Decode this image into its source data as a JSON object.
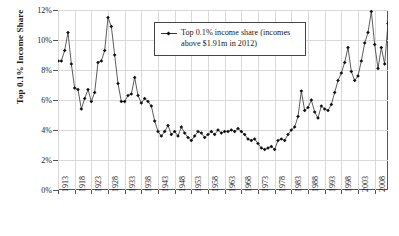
{
  "axes": {
    "ylabel": "Top 0.1% Income Share",
    "yticks": [
      "0%",
      "2%",
      "4%",
      "6%",
      "8%",
      "10%",
      "12%"
    ],
    "xticks": [
      "1913",
      "1918",
      "1923",
      "1928",
      "1933",
      "1938",
      "1943",
      "1948",
      "1953",
      "1958",
      "1963",
      "1968",
      "1973",
      "1978",
      "1983",
      "1988",
      "1993",
      "1998",
      "2003",
      "2008"
    ]
  },
  "legend": {
    "line1": "Top 0.1% income share (incomes",
    "line2": "above $1.91m in 2012)",
    "marker": "line-marker-icon"
  },
  "colors": {
    "line": "#333333",
    "marker": "#111111",
    "grid": "#d9d9d9",
    "frame": "#555555"
  },
  "chart_data": {
    "type": "line",
    "title": "",
    "xlabel": "",
    "ylabel": "Top 0.1% Income Share",
    "xlim": [
      1913,
      2012
    ],
    "ylim": [
      0,
      12
    ],
    "grid": true,
    "legend_position": "top-center",
    "series": [
      {
        "name": "Top 0.1% income share (incomes above $1.91m in 2012)",
        "x": [
          1913,
          1914,
          1915,
          1916,
          1917,
          1918,
          1919,
          1920,
          1921,
          1922,
          1923,
          1924,
          1925,
          1926,
          1927,
          1928,
          1929,
          1930,
          1931,
          1932,
          1933,
          1934,
          1935,
          1936,
          1937,
          1938,
          1939,
          1940,
          1941,
          1942,
          1943,
          1944,
          1945,
          1946,
          1947,
          1948,
          1949,
          1950,
          1951,
          1952,
          1953,
          1954,
          1955,
          1956,
          1957,
          1958,
          1959,
          1960,
          1961,
          1962,
          1963,
          1964,
          1965,
          1966,
          1967,
          1968,
          1969,
          1970,
          1971,
          1972,
          1973,
          1974,
          1975,
          1976,
          1977,
          1978,
          1979,
          1980,
          1981,
          1982,
          1983,
          1984,
          1985,
          1986,
          1987,
          1988,
          1989,
          1990,
          1991,
          1992,
          1993,
          1994,
          1995,
          1996,
          1997,
          1998,
          1999,
          2000,
          2001,
          2002,
          2003,
          2004,
          2005,
          2006,
          2007,
          2008,
          2009,
          2010,
          2011,
          2012
        ],
        "values": [
          8.6,
          8.6,
          9.3,
          10.5,
          8.4,
          6.8,
          6.7,
          5.4,
          6.1,
          6.7,
          5.9,
          6.5,
          8.5,
          8.6,
          9.3,
          11.5,
          10.9,
          9.0,
          7.1,
          5.9,
          5.9,
          6.3,
          6.4,
          7.5,
          6.3,
          5.8,
          6.1,
          5.9,
          5.6,
          4.6,
          3.9,
          3.6,
          3.9,
          4.3,
          3.7,
          3.9,
          3.6,
          4.2,
          3.8,
          3.5,
          3.3,
          3.6,
          3.9,
          3.8,
          3.5,
          3.7,
          3.9,
          3.7,
          4.0,
          3.8,
          3.9,
          3.9,
          4.0,
          3.9,
          4.1,
          3.9,
          3.7,
          3.4,
          3.3,
          3.4,
          3.1,
          2.8,
          2.7,
          2.8,
          2.9,
          2.7,
          3.3,
          3.4,
          3.3,
          3.7,
          4.0,
          4.2,
          4.9,
          6.6,
          5.3,
          5.5,
          6.0,
          5.2,
          4.8,
          5.6,
          5.4,
          5.3,
          5.7,
          6.5,
          7.3,
          7.8,
          8.5,
          9.5,
          7.9,
          7.3,
          7.6,
          8.6,
          9.8,
          10.5,
          11.9,
          9.7,
          8.1,
          9.5,
          8.4,
          11.1
        ]
      }
    ]
  }
}
